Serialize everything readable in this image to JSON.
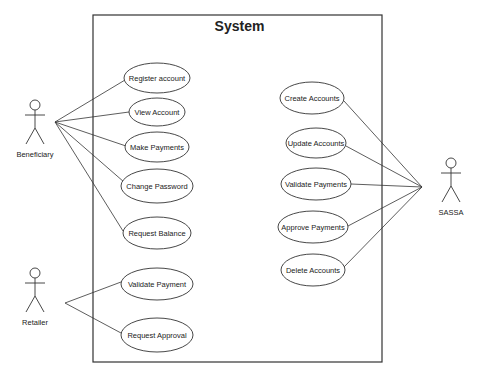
{
  "diagram": {
    "type": "uml-use-case",
    "system": {
      "title": "System",
      "x": 93,
      "y": 15,
      "w": 289,
      "h": 347
    },
    "colors": {
      "stroke": "#333333",
      "text": "#222222",
      "background": "#ffffff"
    },
    "actors": [
      {
        "id": "beneficiary",
        "label": "Beneficiary",
        "x": 35,
        "y": 100,
        "anchor": [
          55,
          122
        ]
      },
      {
        "id": "retailer",
        "label": "Retailer",
        "x": 35,
        "y": 268,
        "anchor": [
          65,
          303
        ]
      },
      {
        "id": "sassa",
        "label": "SASSA",
        "x": 451,
        "y": 158,
        "anchor": [
          422,
          187
        ]
      }
    ],
    "use_cases": [
      {
        "id": "register-account",
        "label": "Register account",
        "cx": 157,
        "cy": 78,
        "rx": 33,
        "ry": 15
      },
      {
        "id": "view-account",
        "label": "View Account",
        "cx": 157,
        "cy": 112,
        "rx": 28,
        "ry": 14
      },
      {
        "id": "make-payments",
        "label": "Make Payments",
        "cx": 157,
        "cy": 147,
        "rx": 32,
        "ry": 15
      },
      {
        "id": "change-password",
        "label": "Change Password",
        "cx": 157,
        "cy": 186,
        "rx": 36,
        "ry": 17
      },
      {
        "id": "request-balance",
        "label": "Request Balance",
        "cx": 157,
        "cy": 233,
        "rx": 34,
        "ry": 16
      },
      {
        "id": "validate-payment",
        "label": "Validate Payment",
        "cx": 157,
        "cy": 284,
        "rx": 36,
        "ry": 16
      },
      {
        "id": "request-approval",
        "label": "Request Approval",
        "cx": 157,
        "cy": 335,
        "rx": 36,
        "ry": 17
      },
      {
        "id": "create-accounts",
        "label": "Create Accounts",
        "cx": 312,
        "cy": 98,
        "rx": 32,
        "ry": 16
      },
      {
        "id": "update-accounts",
        "label": "Update Accounts",
        "cx": 316,
        "cy": 143,
        "rx": 30,
        "ry": 15
      },
      {
        "id": "validate-payments",
        "label": "Validate Payments",
        "cx": 316,
        "cy": 184,
        "rx": 35,
        "ry": 16
      },
      {
        "id": "approve-payments",
        "label": "Approve Payments",
        "cx": 313,
        "cy": 227,
        "rx": 35,
        "ry": 16
      },
      {
        "id": "delete-accounts",
        "label": "Delete Accounts",
        "cx": 313,
        "cy": 270,
        "rx": 32,
        "ry": 16
      }
    ],
    "associations": [
      {
        "from": "beneficiary",
        "to": "register-account",
        "end": [
          125,
          80
        ]
      },
      {
        "from": "beneficiary",
        "to": "view-account",
        "end": [
          129,
          112
        ]
      },
      {
        "from": "beneficiary",
        "to": "make-payments",
        "end": [
          126,
          146
        ]
      },
      {
        "from": "beneficiary",
        "to": "change-password",
        "end": [
          124,
          182
        ]
      },
      {
        "from": "beneficiary",
        "to": "request-balance",
        "end": [
          123,
          231
        ]
      },
      {
        "from": "retailer",
        "to": "validate-payment",
        "end": [
          121,
          282
        ]
      },
      {
        "from": "retailer",
        "to": "request-approval",
        "end": [
          121,
          333
        ]
      },
      {
        "from": "sassa",
        "to": "create-accounts",
        "end": [
          344,
          101
        ]
      },
      {
        "from": "sassa",
        "to": "update-accounts",
        "end": [
          346,
          146
        ]
      },
      {
        "from": "sassa",
        "to": "validate-payments",
        "end": [
          351,
          184
        ]
      },
      {
        "from": "sassa",
        "to": "approve-payments",
        "end": [
          348,
          226
        ]
      },
      {
        "from": "sassa",
        "to": "delete-accounts",
        "end": [
          344,
          267
        ]
      }
    ]
  }
}
